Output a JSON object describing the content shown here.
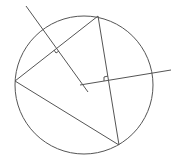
{
  "diagram": {
    "type": "geometry",
    "stroke_color": "#555555",
    "background": "#ffffff",
    "circle": {
      "cx": 84,
      "cy": 85,
      "r": 69
    },
    "triangle": {
      "vertices": [
        {
          "name": "top",
          "x": 98,
          "y": 16
        },
        {
          "name": "left",
          "x": 15,
          "y": 81
        },
        {
          "name": "bottom",
          "x": 119,
          "y": 145
        }
      ]
    },
    "perpendicular_bisectors": [
      {
        "side": "left-top",
        "x1": 26,
        "y1": 6,
        "x2": 88,
        "y2": 92,
        "right_angle_at": {
          "x": 56.5,
          "y": 48.5
        }
      },
      {
        "side": "top-bottom",
        "x1": 80,
        "y1": 85,
        "x2": 171,
        "y2": 70,
        "right_angle_at": {
          "x": 108.5,
          "y": 80.5
        }
      }
    ]
  }
}
